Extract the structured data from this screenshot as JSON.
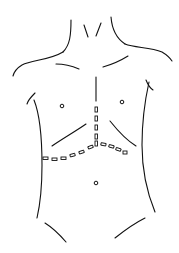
{
  "figure": {
    "annotation": "dashed incision line: vertical midline with bilateral subcostal (chevron) extension",
    "colors": {
      "line": "#111111",
      "background": "#ffffff"
    }
  }
}
